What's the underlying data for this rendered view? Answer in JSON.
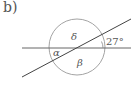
{
  "panel_label": "b)",
  "diagram": {
    "circle": {
      "cx": 77,
      "cy": 47,
      "r": 28,
      "stroke": "#999999"
    },
    "horizontal_line": {
      "x1": 22,
      "y1": 48,
      "x2": 131,
      "y2": 48,
      "stroke": "#666666"
    },
    "diagonal_line": {
      "x1": 22,
      "y1": 77,
      "x2": 131,
      "y2": 19,
      "stroke": "#444444"
    },
    "angle_labels": {
      "delta": "δ",
      "alpha": "α",
      "beta": "β",
      "given": "27°"
    }
  }
}
